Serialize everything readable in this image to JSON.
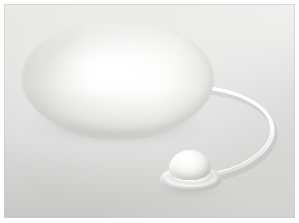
{
  "image": {
    "title": "White egg-shaped device with cord and plug",
    "subject_name": "egg-shaped-white-object",
    "caption": "",
    "width_px": 299,
    "height_px": 223
  },
  "scene": {
    "background_label": "light gray studio backdrop",
    "background_color_top": "#e9e9e6",
    "background_color_bottom": "#d4d5d2",
    "border_color": "#ffffff",
    "border_width_px": 4
  },
  "objects": [
    {
      "name": "egg-body",
      "label": "Large white ellipsoid body",
      "color": "#ffffff",
      "shadow_color": "#6c6c6a",
      "highlight_color": "#ffffff",
      "bounds": {
        "x": 22,
        "y": 20,
        "width": 192,
        "height": 118
      }
    },
    {
      "name": "cable",
      "label": "White cord looping to the right",
      "color": "#fbfbfa",
      "stroke_width_px": 3.2,
      "bounds": {
        "x": 205,
        "y": 85,
        "width": 70,
        "height": 90
      }
    },
    {
      "name": "dome-knob",
      "label": "Small white dome plug with flange base",
      "color": "#fdfdfc",
      "bounds": {
        "x": 156,
        "y": 146,
        "width": 66,
        "height": 46
      }
    }
  ],
  "palette": {
    "white": "#ffffff",
    "off_white": "#f6f6f4",
    "light_gray": "#dedede",
    "mid_gray": "#c2c2bf",
    "shadow_gray": "#6c6c6a"
  }
}
